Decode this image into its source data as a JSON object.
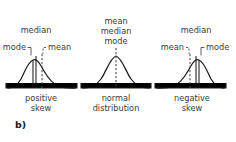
{
  "figure": {
    "tag": "b)",
    "panels": [
      {
        "id": "positive-skew",
        "caption_line1": "positive",
        "caption_line2": "skew",
        "labels": {
          "top": "median",
          "left": "mode",
          "right": "mean"
        },
        "markers": [
          {
            "name": "mode",
            "style": "solid"
          },
          {
            "name": "median",
            "style": "solid"
          },
          {
            "name": "mean",
            "style": "dashed"
          }
        ]
      },
      {
        "id": "normal-distribution",
        "caption_line1": "normal",
        "caption_line2": "distribution",
        "labels": {
          "stack1": "mean",
          "stack2": "median",
          "stack3": "mode"
        },
        "markers": [
          {
            "name": "mean-median-mode",
            "style": "dashed"
          }
        ]
      },
      {
        "id": "negative-skew",
        "caption_line1": "negative",
        "caption_line2": "skew",
        "labels": {
          "top": "median",
          "left": "mean",
          "right": "mode"
        },
        "markers": [
          {
            "name": "mean",
            "style": "dashed"
          },
          {
            "name": "median",
            "style": "solid"
          },
          {
            "name": "mode",
            "style": "solid"
          }
        ]
      }
    ],
    "colors": {
      "curve": "#1c1c1c",
      "text": "#3a3a3a",
      "dashed": "#4a4a4a",
      "background": "#ffffff"
    }
  }
}
